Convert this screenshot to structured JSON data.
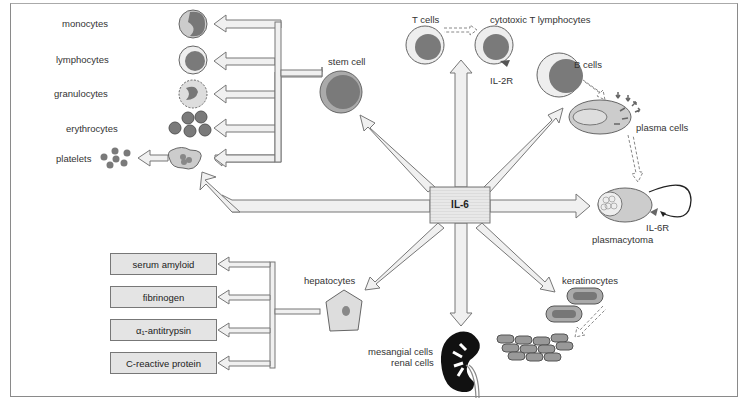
{
  "center": {
    "label": "IL-6"
  },
  "hematopoiesis": {
    "stem_cell": "stem cell",
    "outputs": [
      "monocytes",
      "lymphocytes",
      "granulocytes",
      "erythrocytes",
      "platelets"
    ]
  },
  "t_cells": {
    "source": "T cells",
    "target": "cytotoxic T lymphocytes",
    "receptor": "IL-2R"
  },
  "b_cells": {
    "source": "B cells",
    "target": "plasma cells"
  },
  "plasmacytoma": {
    "label": "plasmacytoma",
    "receptor": "IL-6R"
  },
  "keratinocytes": {
    "label": "keratinocytes"
  },
  "kidney": {
    "line1": "mesangial cells",
    "line2": "renal cells"
  },
  "liver": {
    "label": "hepatocytes",
    "proteins": [
      "serum amyloid",
      "fibrinogen",
      "α₁-antitrypsin",
      "C-reactive protein"
    ]
  },
  "colors": {
    "arrow_fill": "#f0f0f0",
    "arrow_stroke": "#777777",
    "cell_dark": "#7a7a7a",
    "cell_light": "#d8d8d8"
  }
}
